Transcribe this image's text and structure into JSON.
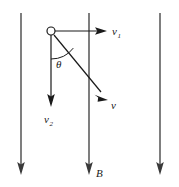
{
  "figure": {
    "background_color": "#ffffff",
    "width": 179,
    "height": 187
  },
  "labels": {
    "v1_symbol": "v",
    "v1_subscript": "1",
    "v2_symbol": "v",
    "v2_subscript": "2",
    "v_symbol": "v",
    "theta_symbol": "θ",
    "b_symbol": "B"
  },
  "colors": {
    "field_line": "#3a3a3a",
    "vector": "#1a1a1a",
    "text": "#1a1a1a",
    "particle_fill": "#ffffff"
  },
  "field_lines": [
    {
      "name": "left-field-line",
      "x": 21,
      "y_top": 13,
      "y_bottom": 174,
      "direction": "down"
    },
    {
      "name": "middle-field-line",
      "x": 89,
      "y_top": 13,
      "y_bottom": 174,
      "direction": "down",
      "label": "B"
    },
    {
      "name": "right-field-line",
      "x": 160,
      "y_top": 13,
      "y_bottom": 174,
      "direction": "down"
    }
  ],
  "particle": {
    "name": "charged-particle",
    "center_x": 51,
    "center_y": 31,
    "radius": 4
  },
  "vectors": [
    {
      "name": "velocity-component-horizontal",
      "label": "v1",
      "from_x": 51,
      "from_y": 31,
      "to_x": 106,
      "to_y": 31,
      "label_x": 112,
      "label_y": 35
    },
    {
      "name": "velocity-component-vertical",
      "label": "v2",
      "from_x": 51,
      "from_y": 31,
      "to_x": 51,
      "to_y": 106,
      "label_x": 44,
      "label_y": 123
    },
    {
      "name": "velocity-resultant",
      "label": "v",
      "from_x": 51,
      "from_y": 31,
      "to_x": 108,
      "to_y": 100,
      "label_x": 111,
      "label_y": 108
    }
  ],
  "angle": {
    "name": "angle-theta",
    "vertex_x": 51,
    "vertex_y": 31,
    "radius": 28,
    "label_x": 57,
    "label_y": 67,
    "between": [
      "velocity-component-vertical",
      "velocity-resultant"
    ]
  }
}
